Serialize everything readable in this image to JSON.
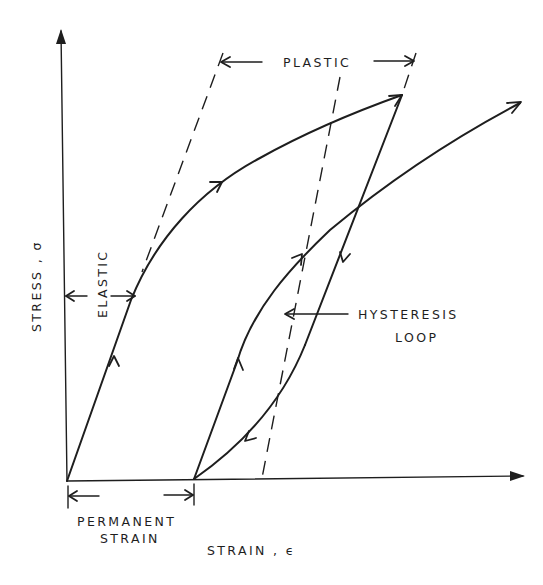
{
  "diagram": {
    "type": "stress-strain curve with hysteresis loop",
    "axes": {
      "y_label": "STRESS , σ",
      "x_label": "STRAIN , ϵ"
    },
    "annotations": {
      "plastic": "PLASTIC",
      "elastic": "ELASTIC",
      "hysteresis_line1": "HYSTERESIS",
      "hysteresis_line2": "LOOP",
      "permanent_line1": "PERMANENT",
      "permanent_line2": "STRAIN"
    },
    "colors": {
      "ink": "#1e1e1e",
      "background": "#ffffff"
    }
  }
}
